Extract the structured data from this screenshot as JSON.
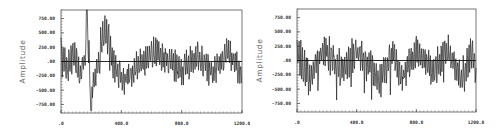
{
  "chart_data": [
    {
      "type": "line",
      "title": "",
      "xlabel": "",
      "ylabel": "Amplitude",
      "xlim": [
        0,
        1200
      ],
      "ylim": [
        -900,
        900
      ],
      "xticks": [
        ".0",
        "400.0",
        "800.0",
        "1200.0"
      ],
      "xtick_values": [
        0,
        400,
        800,
        1200
      ],
      "yticks": [
        "750.00",
        "500.00",
        "250.00",
        ".00",
        "-250.00",
        "-500.00",
        "-750.00"
      ],
      "ytick_values": [
        750,
        500,
        250,
        0,
        -250,
        -500,
        -750
      ],
      "grid": false,
      "zero_line": true,
      "description": "Noisy signal with a transient: sharp spike to ~900 near x=170, deep trough ~-850 near x=200, positive bulge ~500 near x=290, then stationary oscillation within roughly ±300.",
      "series": [
        {
          "name": "signal",
          "key_points": {
            "x": [
              0,
              40,
              80,
              120,
              165,
              175,
              200,
              240,
              290,
              330,
              380,
              420,
              520,
              600,
              700,
              800,
              900,
              1000,
              1100,
              1200
            ],
            "y": [
              200,
              -300,
              250,
              -450,
              150,
              900,
              -850,
              -200,
              500,
              250,
              -200,
              -400,
              -150,
              300,
              100,
              -300,
              200,
              -350,
              250,
              -350
            ]
          }
        }
      ],
      "seed": 7,
      "transient": true
    },
    {
      "type": "line",
      "title": "",
      "xlabel": "",
      "ylabel": "Amplitude",
      "xlim": [
        0,
        1200
      ],
      "ylim": [
        -900,
        900
      ],
      "xticks": [
        ".0",
        "400.0",
        "800.0",
        "1200.0"
      ],
      "xtick_values": [
        0,
        400,
        800,
        1200
      ],
      "yticks": [
        "750.00",
        "500.00",
        "250.00",
        ".00",
        "-250.00",
        "-500.00",
        "-750.00"
      ],
      "ytick_values": [
        750,
        500,
        250,
        0,
        -250,
        -500,
        -750
      ],
      "grid": false,
      "zero_line": true,
      "description": "Stationary noisy oscillation centered at 0, mostly within ±300, with occasional dips to about -550.",
      "series": [
        {
          "name": "signal",
          "key_points": {
            "x": [
              0,
              80,
              180,
              300,
              400,
              560,
              640,
              700,
              800,
              900,
              1000,
              1100,
              1180,
              1200
            ],
            "y": [
              300,
              -550,
              400,
              -350,
              300,
              -600,
              300,
              -550,
              300,
              -400,
              350,
              -500,
              400,
              -450
            ]
          }
        }
      ],
      "seed": 13,
      "transient": false
    }
  ]
}
